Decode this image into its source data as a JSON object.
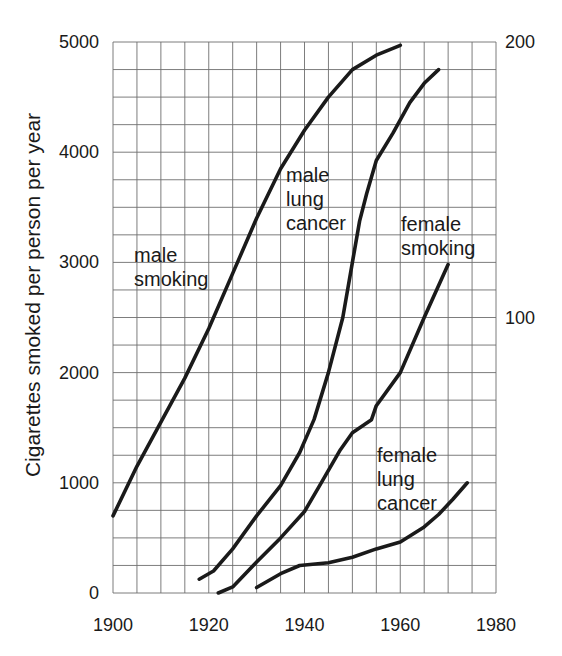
{
  "chart_data": {
    "type": "line",
    "title": "",
    "xlabel": "",
    "ylabel": "Cigarettes smoked per person per year",
    "ylabel_right": "",
    "xlim": [
      1900,
      1980
    ],
    "ylim": [
      0,
      5000
    ],
    "ylim_right": [
      0,
      200
    ],
    "grid": true,
    "grid_x_step": 5,
    "grid_y_step": 250,
    "x_ticks": [
      1900,
      1920,
      1940,
      1960,
      1980
    ],
    "y_ticks": [
      0,
      1000,
      2000,
      3000,
      4000,
      5000
    ],
    "y_ticks_right": [
      100,
      200
    ],
    "series": [
      {
        "name": "male smoking",
        "axis": "left",
        "label_lines": [
          "male",
          "smoking"
        ],
        "points": [
          [
            1900,
            700
          ],
          [
            1905,
            1150
          ],
          [
            1910,
            1550
          ],
          [
            1915,
            1950
          ],
          [
            1920,
            2400
          ],
          [
            1925,
            2900
          ],
          [
            1930,
            3400
          ],
          [
            1935,
            3850
          ],
          [
            1940,
            4200
          ],
          [
            1945,
            4500
          ],
          [
            1950,
            4750
          ],
          [
            1955,
            4880
          ],
          [
            1960,
            4970
          ]
        ]
      },
      {
        "name": "male lung cancer",
        "axis": "right",
        "label_lines": [
          "male",
          "lung",
          "cancer"
        ],
        "points": [
          [
            1918,
            5
          ],
          [
            1921,
            8
          ],
          [
            1925,
            16
          ],
          [
            1930,
            28
          ],
          [
            1935,
            39
          ],
          [
            1939,
            51
          ],
          [
            1942,
            63
          ],
          [
            1945,
            80
          ],
          [
            1948,
            100
          ],
          [
            1950,
            120
          ],
          [
            1951.5,
            135
          ],
          [
            1953,
            145
          ],
          [
            1955,
            157
          ],
          [
            1958.5,
            167
          ],
          [
            1962,
            178
          ],
          [
            1965,
            185
          ],
          [
            1968,
            190
          ]
        ]
      },
      {
        "name": "female smoking",
        "axis": "left",
        "label_lines": [
          "female",
          "smoking"
        ],
        "points": [
          [
            1922,
            0
          ],
          [
            1925,
            55
          ],
          [
            1930,
            280
          ],
          [
            1935,
            500
          ],
          [
            1940,
            740
          ],
          [
            1943,
            964
          ],
          [
            1947.5,
            1300
          ],
          [
            1950,
            1455
          ],
          [
            1954,
            1573
          ],
          [
            1955,
            1700
          ],
          [
            1960,
            2000
          ],
          [
            1965,
            2500
          ],
          [
            1970,
            2980
          ]
        ]
      },
      {
        "name": "female lung cancer",
        "axis": "right",
        "label_lines": [
          "female",
          "lung",
          "cancer"
        ],
        "points": [
          [
            1930,
            2
          ],
          [
            1935,
            7
          ],
          [
            1939,
            10
          ],
          [
            1945,
            11
          ],
          [
            1950,
            13
          ],
          [
            1955,
            16
          ],
          [
            1960,
            18.5
          ],
          [
            1965,
            24
          ],
          [
            1968,
            28.5
          ],
          [
            1971,
            34
          ],
          [
            1974,
            40
          ]
        ]
      }
    ]
  },
  "caption": {
    "visible_text": ""
  }
}
